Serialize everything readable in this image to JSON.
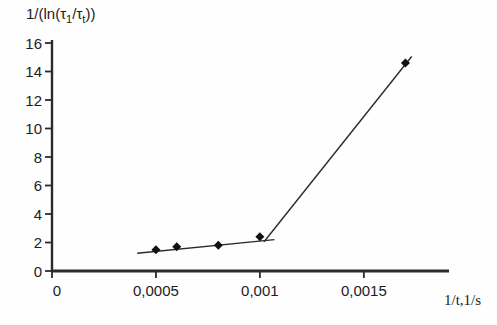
{
  "chart_data": {
    "type": "scatter",
    "title": "",
    "xlabel": "1/t,1/s",
    "ylabel": "1/(ln(τ1/τt))",
    "ylabel_parts": [
      {
        "t": "1/(ln(τ"
      },
      {
        "t": "1",
        "sub": true
      },
      {
        "t": "/τ"
      },
      {
        "t": "t",
        "sub": true
      },
      {
        "t": "))"
      }
    ],
    "x": [
      0.0005,
      0.0006,
      0.0008,
      0.001,
      0.0017
    ],
    "y": [
      1.5,
      1.7,
      1.8,
      2.4,
      14.6
    ],
    "x_ticks": [
      {
        "v": 0,
        "label": "0"
      },
      {
        "v": 0.0005,
        "label": "0,0005"
      },
      {
        "v": 0.001,
        "label": "0,001"
      },
      {
        "v": 0.0015,
        "label": "0,0015"
      }
    ],
    "y_ticks": [
      {
        "v": 0,
        "label": "0"
      },
      {
        "v": 2,
        "label": "2"
      },
      {
        "v": 4,
        "label": "4"
      },
      {
        "v": 6,
        "label": "6"
      },
      {
        "v": 8,
        "label": "8"
      },
      {
        "v": 10,
        "label": "10"
      },
      {
        "v": 12,
        "label": "12"
      },
      {
        "v": 14,
        "label": "14"
      },
      {
        "v": 16,
        "label": "16"
      }
    ],
    "xlim": [
      0,
      0.0019
    ],
    "ylim": [
      0,
      16
    ],
    "grid": false,
    "legend": null,
    "marker": {
      "shape": "diamond",
      "size": 9,
      "color": "#121212"
    },
    "trendlines": [
      {
        "x1": 0.00041,
        "y1": 1.25,
        "x2": 0.00107,
        "y2": 2.2
      },
      {
        "x1": 0.00102,
        "y1": 2.05,
        "x2": 0.00173,
        "y2": 15.05
      }
    ],
    "colors": {
      "axis": "#2b2b2b",
      "line": "#2b2b2b",
      "text": "#1c1c1c",
      "background": "#fefefe"
    }
  }
}
